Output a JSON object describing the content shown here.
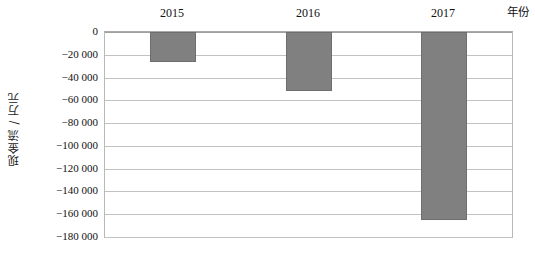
{
  "chart_data": {
    "type": "bar",
    "title": "",
    "subtitle": "",
    "xlabel": "年份",
    "ylabel": "现金流 / 万元",
    "categories": [
      "2015",
      "2016",
      "2017"
    ],
    "values": [
      -26000,
      -52000,
      -165000
    ],
    "series": [
      {
        "name": "现金流",
        "values": [
          -26000,
          -52000,
          -165000
        ],
        "color": "#808080"
      }
    ],
    "ylim": [
      -180000,
      0
    ],
    "ytick_values": [
      0,
      -20000,
      -40000,
      -60000,
      -80000,
      -100000,
      -120000,
      -140000,
      -160000,
      -180000
    ],
    "ytick_labels": [
      "0",
      "−20 000",
      "−40 000",
      "−60 000",
      "−80 000",
      "−100 000",
      "−120 000",
      "−140 000",
      "−160 000",
      "−180 000"
    ],
    "grid": true,
    "grid_axis": "y",
    "legend": false,
    "legend_position": "none",
    "category_label_position": "top",
    "xlabel_position": "top-right",
    "bar_color": "#808080",
    "bar_edge_color": "#6e6e6e",
    "gridline_color": "#c2c2c2",
    "plot_border_color": "#b9b9b9",
    "background_color": "#ffffff"
  }
}
